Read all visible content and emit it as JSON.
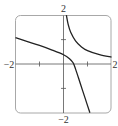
{
  "chart_data": {
    "type": "line",
    "title": "",
    "xlabel": "",
    "ylabel": "",
    "xlim": [
      -2,
      2
    ],
    "ylim": [
      -2,
      2
    ],
    "grid": false,
    "tick_labels": {
      "x_min": "−2",
      "x_max": "2",
      "y_min": "−2",
      "y_max": "2"
    },
    "ticks": {
      "x": [
        -1,
        1
      ],
      "y": [
        -1,
        1
      ]
    },
    "series": [
      {
        "name": "left-branch",
        "points": [
          [
            -2,
            1.08
          ],
          [
            -1.5,
            0.92
          ],
          [
            -1,
            0.76
          ],
          [
            -0.5,
            0.58
          ],
          [
            0,
            0.38
          ],
          [
            0.25,
            0.22
          ],
          [
            0.4,
            0.05
          ],
          [
            0.5,
            -0.2
          ],
          [
            0.7,
            -0.8
          ],
          [
            0.9,
            -1.4
          ],
          [
            1.1,
            -2.0
          ]
        ]
      },
      {
        "name": "right-branch",
        "points": [
          [
            0.12,
            2.0
          ],
          [
            0.2,
            1.6
          ],
          [
            0.3,
            1.3
          ],
          [
            0.5,
            0.95
          ],
          [
            0.75,
            0.7
          ],
          [
            1,
            0.55
          ],
          [
            1.5,
            0.38
          ],
          [
            2,
            0.28
          ]
        ]
      }
    ],
    "colors": {
      "curve": "#222222",
      "axis": "#555555",
      "frame": "#999999"
    }
  }
}
